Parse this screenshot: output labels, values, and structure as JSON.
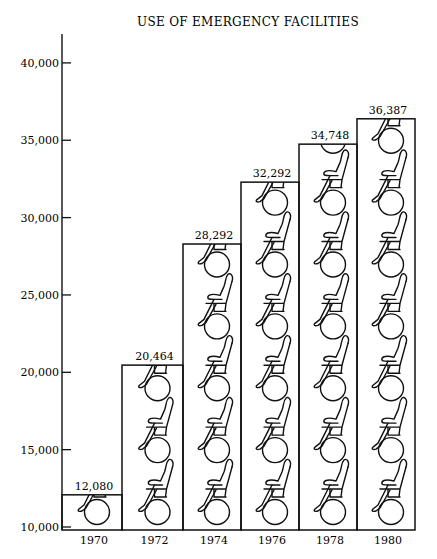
{
  "chart_data": {
    "type": "bar",
    "subtype": "pictograph",
    "title": "USE OF EMERGENCY FACILITIES",
    "xlabel": "",
    "ylabel": "",
    "categories": [
      "1970",
      "1972",
      "1974",
      "1976",
      "1978",
      "1980"
    ],
    "values": [
      12080,
      20464,
      28292,
      32292,
      34748,
      36387
    ],
    "value_labels": [
      "12,080",
      "20,464",
      "28,292",
      "32,292",
      "34,748",
      "36,387"
    ],
    "yticks": [
      10000,
      15000,
      20000,
      25000,
      30000,
      35000,
      40000
    ],
    "ytick_labels": [
      "10,000",
      "15,000",
      "20,000",
      "25,000",
      "30,000",
      "35,000",
      "40,000"
    ],
    "ylim": [
      10000,
      41500
    ],
    "grid": false,
    "legend": null,
    "icon": "wheelchair-icon",
    "icon_unit": 4000
  }
}
